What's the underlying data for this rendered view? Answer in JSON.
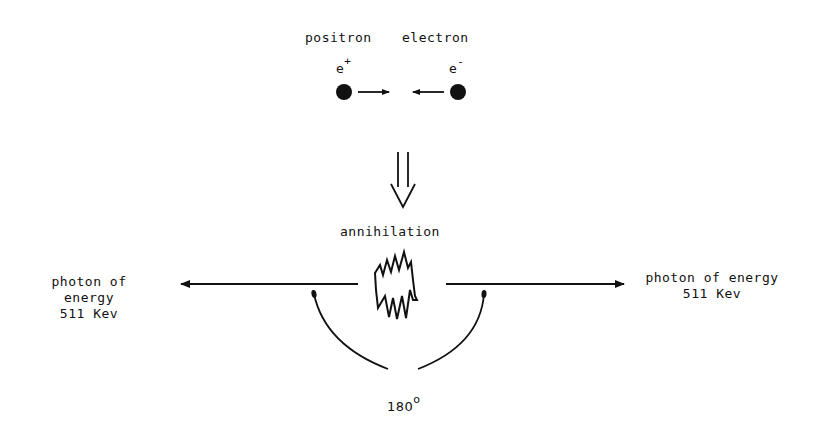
{
  "particles": {
    "positron": {
      "name": "positron",
      "symbol": "e",
      "charge": "+"
    },
    "electron": {
      "name": "electron",
      "symbol": "e",
      "charge": "-"
    }
  },
  "process": {
    "label": "annihilation"
  },
  "photons": {
    "left": {
      "line1": "photon of",
      "line2": "energy",
      "line3": "511 Kev"
    },
    "right": {
      "line1": "photon of energy",
      "line2": "511 Kev"
    }
  },
  "angle": {
    "value": "180",
    "unit": "o"
  },
  "colors": {
    "ink": "#111111",
    "background": "#ffffff"
  }
}
